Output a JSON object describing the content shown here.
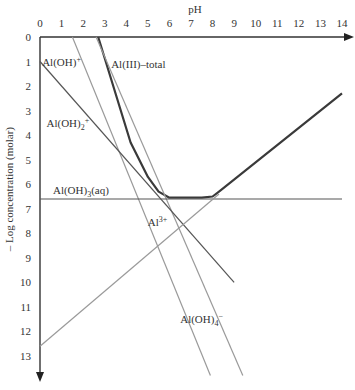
{
  "chart_data": {
    "type": "line",
    "title": "",
    "xlabel": "pH",
    "ylabel": "– Log concentration (molar)",
    "xlim": [
      0,
      14
    ],
    "ylim": [
      0,
      13.5
    ],
    "y_inverted": true,
    "x_ticks": [
      "0",
      "1",
      "2",
      "3",
      "4",
      "5",
      "6",
      "7",
      "8",
      "9",
      "10",
      "11",
      "12",
      "13",
      "14"
    ],
    "y_ticks": [
      "0",
      "1",
      "2",
      "3",
      "4",
      "5",
      "6",
      "7",
      "8",
      "9",
      "10",
      "11",
      "12",
      "13"
    ],
    "grid": false,
    "series": [
      {
        "name": "Al(III)–total",
        "x": [
          2.7,
          4.2,
          5.0,
          5.5,
          6.0,
          7.5,
          8.0,
          8.3,
          14.0
        ],
        "y": [
          0.0,
          4.3,
          5.7,
          6.3,
          6.55,
          6.55,
          6.5,
          6.3,
          2.3
        ],
        "style": "bold"
      },
      {
        "name": "Al(OH)+",
        "x": [
          1.5,
          7.9
        ],
        "y": [
          0.0,
          13.8
        ],
        "style": "light"
      },
      {
        "name": "Al3+",
        "x": [
          2.6,
          9.4
        ],
        "y": [
          0.0,
          13.8
        ],
        "style": "light"
      },
      {
        "name": "Al(OH)2+",
        "x": [
          0.0,
          9.0
        ],
        "y": [
          1.0,
          10.0
        ],
        "style": "medium"
      },
      {
        "name": "Al(OH)3(aq)",
        "x": [
          0.0,
          14.0
        ],
        "y": [
          6.6,
          6.6
        ],
        "style": "medium"
      },
      {
        "name": "Al(OH)4−",
        "x": [
          0.0,
          8.3
        ],
        "y": [
          12.6,
          6.4
        ],
        "style": "light"
      }
    ],
    "annotations": [
      {
        "text": "Al(OH)",
        "sup": "+",
        "x": 0.1,
        "y": 1.0
      },
      {
        "text": "Al(III)–total",
        "x": 3.3,
        "y": 1.1
      },
      {
        "text": "Al(OH)",
        "sub": "2",
        "sup": "+",
        "x": 0.3,
        "y": 3.5
      },
      {
        "text": "Al(OH)",
        "sub": "3",
        "tail": "(aq)",
        "x": 0.6,
        "y": 6.25
      },
      {
        "text": "Al",
        "sup": "3+",
        "x": 5.0,
        "y": 7.55
      },
      {
        "text": "Al(OH)",
        "sub": "4",
        "sup": "−",
        "x": 6.5,
        "y": 11.5
      }
    ]
  }
}
